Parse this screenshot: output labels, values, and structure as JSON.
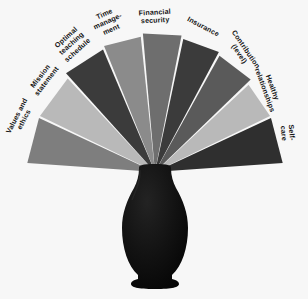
{
  "diagram": {
    "background_color": "#f7f7f7",
    "center": {
      "x": 155,
      "y": 172
    },
    "vase": {
      "name": "black ceramic vase",
      "color": "#0d0d0d"
    },
    "palette": {
      "dark": "#3b3b3b",
      "mid": "#7e7e7e",
      "light": "#b9b9b9",
      "gap": "#f7f7f7"
    },
    "petals": [
      {
        "label": "Values and\nethics",
        "color": "#7e7e7e",
        "tone": "mid",
        "start_angle": 184,
        "end_angle": 205,
        "radius": 128,
        "label_x": 21,
        "label_y": 118,
        "label_rotation": -63
      },
      {
        "label": "Mission\nstatement",
        "color": "#b9b9b9",
        "tone": "light",
        "start_angle": 206,
        "end_angle": 227,
        "radius": 128,
        "label_x": 44,
        "label_y": 79,
        "label_rotation": -52
      },
      {
        "label": "Optimal\nteaching\nschedule",
        "color": "#3b3b3b",
        "tone": "dark",
        "start_angle": 228,
        "end_angle": 247,
        "radius": 133,
        "label_x": 72,
        "label_y": 44,
        "label_rotation": -42
      },
      {
        "label": "Time\nmanage-\nment",
        "color": "#8b8b8b",
        "tone": "mid",
        "start_angle": 248,
        "end_angle": 264,
        "radius": 136,
        "label_x": 108,
        "label_y": 22,
        "label_rotation": -24
      },
      {
        "label": "Financial\nsecurity",
        "color": "#6e6e6e",
        "tone": "mid",
        "start_angle": 265,
        "end_angle": 281,
        "radius": 139,
        "label_x": 155,
        "label_y": 17,
        "label_rotation": -3
      },
      {
        "label": "Insurance",
        "color": "#3b3b3b",
        "tone": "dark",
        "start_angle": 282,
        "end_angle": 298,
        "radius": 136,
        "label_x": 203,
        "label_y": 27,
        "label_rotation": 28
      },
      {
        "label": "Contribution\n(level)",
        "color": "#5a5a5a",
        "tone": "mid",
        "start_angle": 299,
        "end_angle": 316,
        "radius": 133,
        "label_x": 242,
        "label_y": 52,
        "label_rotation": 56
      },
      {
        "label": "Healthy\nrelationships",
        "color": "#b9b9b9",
        "tone": "light",
        "start_angle": 317,
        "end_angle": 334,
        "radius": 128,
        "label_x": 268,
        "label_y": 89,
        "label_rotation": 70
      },
      {
        "label": "Self-care",
        "color": "#2f2f2f",
        "tone": "dark",
        "start_angle": 335,
        "end_angle": 356,
        "radius": 128,
        "label_x": 287,
        "label_y": 133,
        "label_rotation": 85
      }
    ]
  }
}
